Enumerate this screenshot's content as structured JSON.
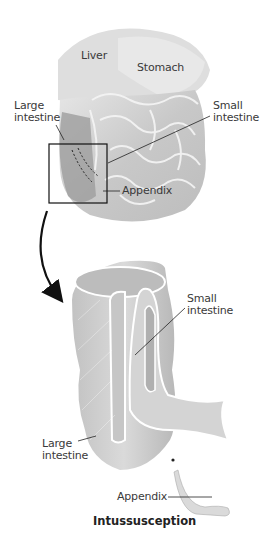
{
  "figure": {
    "title": "Intussusception",
    "top_view": {
      "labels": {
        "liver": "Liver",
        "stomach": "Stomach",
        "large_intestine_1": "Large",
        "large_intestine_2": "intestine",
        "small_intestine_1": "Small",
        "small_intestine_2": "intestine",
        "appendix": "Appendix"
      }
    },
    "detail_view": {
      "labels": {
        "small_intestine_1": "Small",
        "small_intestine_2": "intestine",
        "large_intestine_1": "Large",
        "large_intestine_2": "intestine",
        "appendix": "Appendix"
      }
    },
    "colors": {
      "organ_fill": "#cfcfcf",
      "organ_shade": "#a9a9a9",
      "outline": "#ffffff",
      "line": "#222222"
    }
  }
}
